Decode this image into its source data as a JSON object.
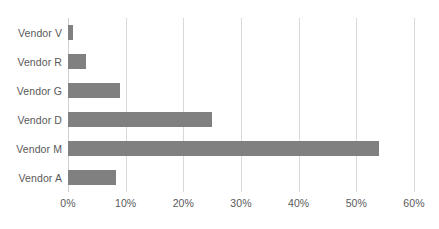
{
  "chart_data": {
    "type": "bar",
    "orientation": "horizontal",
    "title": "",
    "subtitle": "",
    "xlabel": "",
    "ylabel": "",
    "categories": [
      "Vendor V",
      "Vendor R",
      "Vendor G",
      "Vendor D",
      "Vendor M",
      "Vendor A"
    ],
    "values": [
      0.9,
      3.1,
      9.0,
      25.0,
      54.0,
      8.3
    ],
    "value_format": "percent",
    "xlim": [
      0,
      60
    ],
    "xticks": [
      0,
      10,
      20,
      30,
      40,
      50,
      60
    ],
    "xtick_labels": [
      "0%",
      "10%",
      "20%",
      "30%",
      "40%",
      "50%",
      "60%"
    ],
    "grid": "vertical",
    "legend": "none",
    "series": [
      {
        "name": "",
        "color": "#808080",
        "values": [
          0.9,
          3.1,
          9.0,
          25.0,
          54.0,
          8.3
        ]
      }
    ]
  },
  "colors": {
    "bar": "#808080",
    "gridline": "#d9d9d9",
    "axis": "#d0d0d0",
    "text": "#595959",
    "background": "#ffffff"
  }
}
